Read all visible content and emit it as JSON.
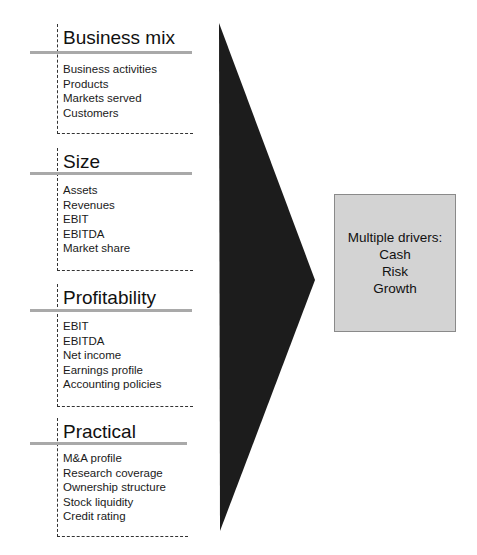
{
  "colors": {
    "arrow": "#1c1c1c",
    "box_fill": "#d3d3d3",
    "box_border": "#8a8a8a",
    "title_bar": "#a9a9a9",
    "dashed_line": "#333333"
  },
  "sections": [
    {
      "title": "Business mix",
      "items": [
        "Business activities",
        "Products",
        "Markets served",
        "Customers"
      ]
    },
    {
      "title": "Size",
      "items": [
        "Assets",
        "Revenues",
        "EBIT",
        "EBITDA",
        "Market share"
      ]
    },
    {
      "title": "Profitability",
      "items": [
        "EBIT",
        "EBITDA",
        "Net income",
        "Earnings profile",
        "Accounting policies"
      ]
    },
    {
      "title": "Practical",
      "items": [
        "M&A profile",
        "Research coverage",
        "Ownership structure",
        "Stock liquidity",
        "Credit rating"
      ]
    }
  ],
  "result_box": {
    "heading": "Multiple drivers:",
    "lines": [
      "Cash",
      "Risk",
      "Growth"
    ]
  }
}
